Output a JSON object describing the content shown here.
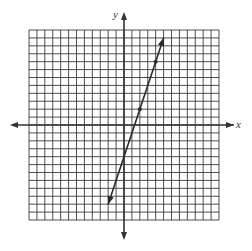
{
  "graph": {
    "x_axis_label": "x",
    "y_axis_label": "y",
    "grid": {
      "xmin": -12,
      "xmax": 12,
      "ymin": -12,
      "ymax": 12,
      "step": 1
    },
    "colors": {
      "grid": "#3a3a3a",
      "axis": "#333333",
      "line": "#2a2a2a",
      "background": "#ffffff"
    }
  },
  "chart_data": {
    "type": "line",
    "title": "",
    "xlabel": "x",
    "ylabel": "y",
    "xlim": [
      -12,
      12
    ],
    "ylim": [
      -12,
      12
    ],
    "grid": true,
    "series": [
      {
        "name": "y = 3x - 4",
        "equation": "y = 3x - 4",
        "endpoints_arrows": [
          [
            -2,
            -10
          ],
          [
            5,
            11
          ]
        ],
        "marked_points": [
          [
            2,
            2
          ],
          [
            4,
            8
          ]
        ]
      }
    ]
  }
}
